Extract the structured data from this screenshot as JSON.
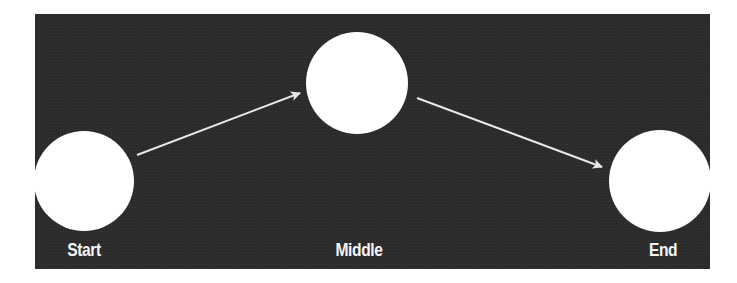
{
  "diagram": {
    "background_color": "#2b2b2b",
    "node_color": "#ffffff",
    "arrow_color": "#e8e8e8",
    "nodes": [
      {
        "id": "start",
        "label": "Start",
        "cx": 84,
        "cy": 181,
        "r": 50
      },
      {
        "id": "middle",
        "label": "Middle",
        "cx": 357,
        "cy": 83,
        "r": 51
      },
      {
        "id": "end",
        "label": "End",
        "cx": 660,
        "cy": 181,
        "r": 51
      }
    ],
    "edges": [
      {
        "from": "start",
        "to": "middle",
        "x1": 137,
        "y1": 155,
        "x2": 300,
        "y2": 93
      },
      {
        "from": "middle",
        "to": "end",
        "x1": 417,
        "y1": 98,
        "x2": 602,
        "y2": 167
      }
    ]
  }
}
